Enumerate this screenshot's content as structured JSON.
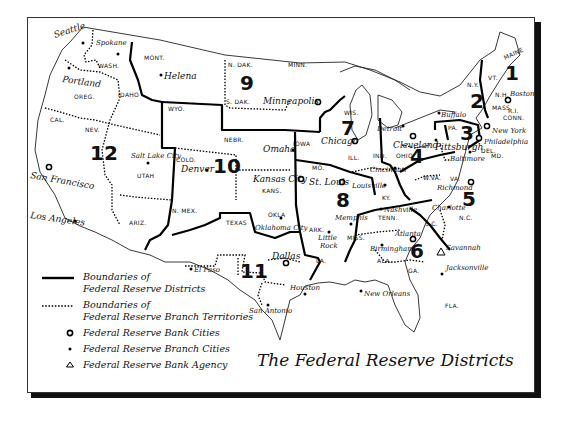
{
  "title": "The Federal Reserve Districts",
  "legend": [
    {
      "symbol": "solid-line",
      "label_line1": "Boundaries of",
      "label_line2": "Federal Reserve Districts"
    },
    {
      "symbol": "dotted-line",
      "label_line1": "Boundaries of",
      "label_line2": "Federal Reserve Branch Territories"
    },
    {
      "symbol": "open-circle",
      "label": "Federal Reserve Bank Cities"
    },
    {
      "symbol": "dot",
      "label": "Federal Reserve Branch Cities"
    },
    {
      "symbol": "triangle",
      "label": "Federal Reserve Bank Agency"
    }
  ],
  "districts": [
    "1",
    "2",
    "3",
    "4",
    "5",
    "6",
    "7",
    "8",
    "9",
    "10",
    "11",
    "12"
  ],
  "states": {
    "wash": "WASH.",
    "oreg": "OREG.",
    "cal": "CAL.",
    "idaho": "IDAHO",
    "nev": "NEV.",
    "mont": "MONT.",
    "wyo": "WYO.",
    "utah": "UTAH",
    "ariz": "ARIZ.",
    "colo": "COLO.",
    "nmex": "N. MEX.",
    "ndak": "N. DAK.",
    "sdak": "S. DAK.",
    "nebr": "NEBR.",
    "kans": "KANS.",
    "okla": "OKLA",
    "texas": "TEXAS",
    "minn": "MINN.",
    "iowa": "IOWA",
    "mo": "MO.",
    "ark": "ARK.",
    "la": "LA.",
    "wis": "WIS.",
    "ill": "ILL.",
    "ind": "IND.",
    "mich": "MICH.",
    "ohio": "OHIO",
    "ky": "KY.",
    "tenn": "TENN.",
    "miss": "MISS.",
    "ala": "ALA.",
    "ga": "GA.",
    "fla": "FLA.",
    "sc": "S.C.",
    "nc": "N.C.",
    "va": "VA.",
    "wva": "W.VA.",
    "pa": "PA.",
    "ny": "N.Y.",
    "vt": "VT.",
    "nh": "N.H.",
    "maine": "MAINE",
    "mass": "MASS.",
    "ri": "R.I.",
    "conn": "CONN.",
    "nj": "N.J.",
    "del": "DEL.",
    "md": "MD."
  },
  "cities": {
    "seattle": "Seattle",
    "spokane": "Spokane",
    "portland": "Portland",
    "helena": "Helena",
    "san_francisco": "San Francisco",
    "los_angeles": "Los Angeles",
    "salt_lake_city": "Salt Lake City",
    "denver": "Denver",
    "omaha": "Omaha",
    "kansas_city": "Kansas City",
    "oklahoma_city": "Oklahoma City",
    "el_paso": "El Paso",
    "dallas": "Dallas",
    "houston": "Houston",
    "san_antonio": "San Antonio",
    "minneapolis": "Minneapolis",
    "chicago": "Chicago",
    "detroit": "Detroit",
    "st_louis": "St. Louis",
    "louisville": "Louisville",
    "little_rock_1": "Little",
    "little_rock_2": "Rock",
    "memphis": "Memphis",
    "nashville": "Nashville",
    "new_orleans": "New Orleans",
    "atlanta": "Atlanta",
    "birmingham": "Birmingham",
    "jacksonville": "Jacksonville",
    "savannah": "Savannah",
    "cleveland": "Cleveland",
    "cincinnati": "Cincinnati",
    "pittsburgh": "Pittsburgh",
    "buffalo": "Buffalo",
    "baltimore": "Baltimore",
    "richmond": "Richmond",
    "charlotte": "Charlotte",
    "new_york": "New York",
    "philadelphia": "Philadelphia",
    "boston": "Boston"
  }
}
